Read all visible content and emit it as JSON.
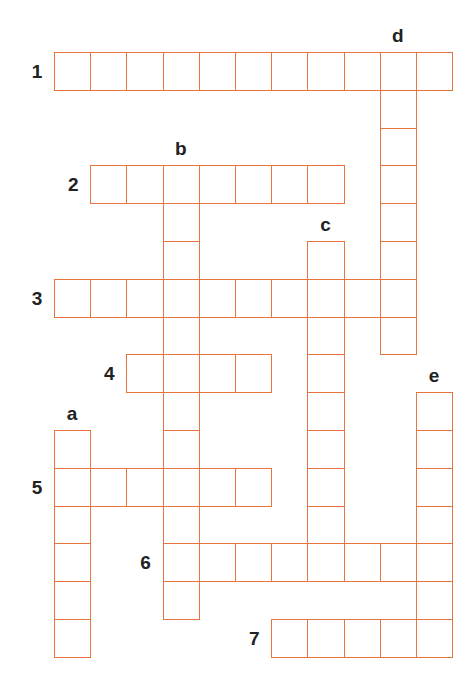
{
  "puzzle": {
    "type": "crossword",
    "grid": {
      "origin_x": 54,
      "origin_y": 52,
      "cell_w": 36.2,
      "cell_h": 37.8
    },
    "line_color": "#e8743b",
    "label_color": "#222222",
    "across": [
      {
        "label": "1",
        "row": 0,
        "col": 0,
        "length": 11
      },
      {
        "label": "2",
        "row": 3,
        "col": 1,
        "length": 7
      },
      {
        "label": "3",
        "row": 6,
        "col": 0,
        "length": 10
      },
      {
        "label": "4",
        "row": 8,
        "col": 2,
        "length": 4
      },
      {
        "label": "5",
        "row": 11,
        "col": 0,
        "length": 6
      },
      {
        "label": "6",
        "row": 13,
        "col": 3,
        "length": 8
      },
      {
        "label": "7",
        "row": 15,
        "col": 6,
        "length": 5
      }
    ],
    "down": [
      {
        "label": "a",
        "row": 10,
        "col": 0,
        "length": 6
      },
      {
        "label": "b",
        "row": 3,
        "col": 3,
        "length": 12
      },
      {
        "label": "c",
        "row": 5,
        "col": 7,
        "length": 9
      },
      {
        "label": "d",
        "row": 0,
        "col": 9,
        "length": 8
      },
      {
        "label": "e",
        "row": 9,
        "col": 10,
        "length": 7
      }
    ]
  }
}
